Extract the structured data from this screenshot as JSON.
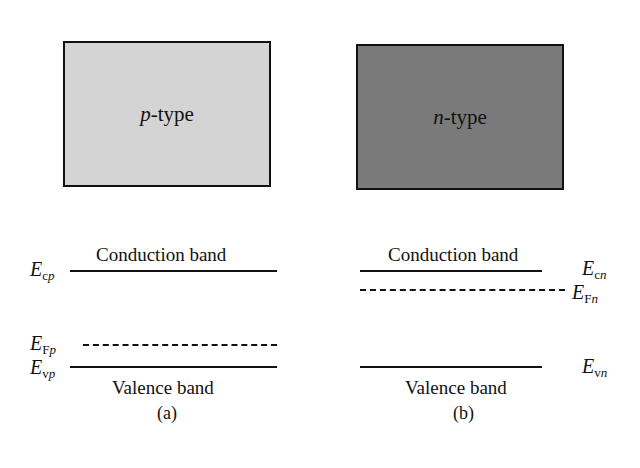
{
  "figure": {
    "panel_a": {
      "caption": "(a)",
      "material": {
        "italic_letter": "p",
        "suffix": "-type",
        "fill_color": "#d4d4d4"
      },
      "conduction_band_label": "Conduction band",
      "valence_band_label": "Valence band",
      "levels": {
        "Ec": {
          "main": "E",
          "sub_roman": "c",
          "sub_italic": "p",
          "style": "solid"
        },
        "EF": {
          "main": "E",
          "sub_roman": "F",
          "sub_italic": "p",
          "style": "dashed"
        },
        "Ev": {
          "main": "E",
          "sub_roman": "v",
          "sub_italic": "p",
          "style": "solid"
        }
      }
    },
    "panel_b": {
      "caption": "(b)",
      "material": {
        "italic_letter": "n",
        "suffix": "-type",
        "fill_color": "#7a7a7a"
      },
      "conduction_band_label": "Conduction band",
      "valence_band_label": "Valence band",
      "levels": {
        "Ec": {
          "main": "E",
          "sub_roman": "c",
          "sub_italic": "n",
          "style": "solid"
        },
        "EF": {
          "main": "E",
          "sub_roman": "F",
          "sub_italic": "n",
          "style": "dashed"
        },
        "Ev": {
          "main": "E",
          "sub_roman": "v",
          "sub_italic": "n",
          "style": "solid"
        }
      }
    }
  }
}
